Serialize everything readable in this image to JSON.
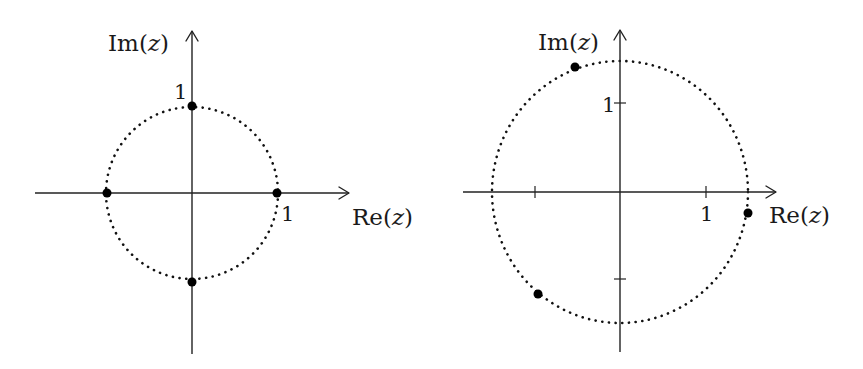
{
  "diagrams": [
    {
      "id": "left",
      "title": "Fourth roots of unity",
      "x_axis_label": "Re(z)",
      "x_axis_label_prefix": "Re(",
      "x_axis_label_var": "z",
      "x_axis_label_suffix": ")",
      "y_axis_label_prefix": "Im(",
      "y_axis_label_var": "z",
      "y_axis_label_suffix": ")",
      "x_tick_label": "1",
      "y_tick_label": "1",
      "circle_radius": 1,
      "circle_style": "dotted",
      "points": [
        {
          "re": 1,
          "im": 0
        },
        {
          "re": 0,
          "im": 1
        },
        {
          "re": -1,
          "im": 0
        },
        {
          "re": 0,
          "im": -1
        }
      ]
    },
    {
      "id": "right",
      "x_axis_label_prefix": "Re(",
      "x_axis_label_var": "z",
      "x_axis_label_suffix": ")",
      "y_axis_label_prefix": "Im(",
      "y_axis_label_var": "z",
      "y_axis_label_suffix": ")",
      "x_tick_label": "1",
      "y_tick_label": "1",
      "ticks": {
        "x": [
          -1,
          1
        ],
        "y": [
          -1,
          1
        ]
      },
      "circle_radius": 1.5,
      "circle_style": "dotted",
      "points": [
        {
          "re": 1.48,
          "im": -0.24
        },
        {
          "re": -0.53,
          "im": 1.43
        },
        {
          "re": -0.95,
          "im": -1.17
        }
      ]
    }
  ],
  "colors": {
    "ink": "#111111",
    "background": "#ffffff"
  }
}
